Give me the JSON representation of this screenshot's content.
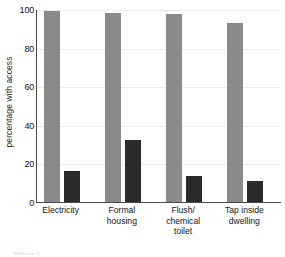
{
  "chart_data": {
    "type": "bar",
    "title": "",
    "subtitle": "",
    "xlabel": "",
    "ylabel": "percentage with access",
    "ylim": [
      0,
      100
    ],
    "yticks": [
      0,
      20,
      40,
      60,
      80,
      100
    ],
    "grid": true,
    "legend": "none",
    "categories": [
      "Electricity",
      "Formal housing",
      "Flush/ chemical toilet",
      "Tap inside dwelling"
    ],
    "category_lines": [
      [
        "Electricity"
      ],
      [
        "Formal",
        "housing"
      ],
      [
        "Flush/",
        "chemical",
        "toilet"
      ],
      [
        "Tap inside",
        "dwelling"
      ]
    ],
    "series": [
      {
        "name": "primary",
        "color": "#8a8a8a",
        "values": [
          99,
          98,
          97.5,
          93
        ]
      },
      {
        "name": "secondary",
        "color": "#2a2a2a",
        "values": [
          16,
          32,
          13.5,
          11
        ]
      }
    ]
  },
  "axis": {
    "tick_labels": [
      "0",
      "20",
      "40",
      "60",
      "80",
      "100"
    ],
    "y_title": "percentage with access"
  },
  "colors": {
    "bar_primary": "#8a8a8a",
    "bar_secondary": "#2a2a2a",
    "axis_line": "#4a4a4a",
    "gridline": "#ececec",
    "background": "#ffffff",
    "text": "#1a1a1a"
  },
  "caption_sliver": {
    "text": "Figure 1"
  }
}
